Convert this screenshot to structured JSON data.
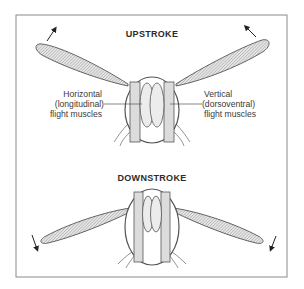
{
  "figure": {
    "frame_color": "#8a8a8a",
    "wing_fill": "#d4d4d4",
    "muscle_fill": "#dedede",
    "outline_color": "#555555"
  },
  "upstroke": {
    "title": "UPSTROKE",
    "label_left": [
      "Horizontal",
      "(longitudinal)",
      "flight muscles"
    ],
    "label_right": [
      "Vertical",
      "(dorsoventral)",
      "flight muscles"
    ]
  },
  "downstroke": {
    "title": "DOWNSTROKE"
  }
}
